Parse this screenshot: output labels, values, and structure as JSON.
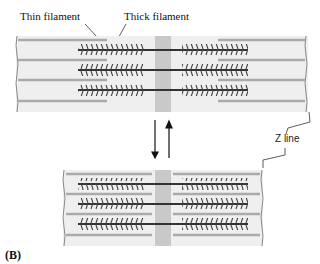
{
  "figure": {
    "panel_label": "(B)",
    "labels": {
      "thin_filament": "Thin filament",
      "thick_filament": "Thick filament",
      "z_line": "Z line"
    },
    "states": [
      {
        "name": "relaxed",
        "description": "Top sarcomere, extended"
      },
      {
        "name": "contracted",
        "description": "Bottom sarcomere, shortened"
      }
    ],
    "arrows": [
      "down",
      "up"
    ],
    "colors": {
      "background": "#eeeeee",
      "m_band": "#c8c8c8",
      "thin_filament": "#a8a8a8",
      "thick_filament": "#333333"
    }
  }
}
